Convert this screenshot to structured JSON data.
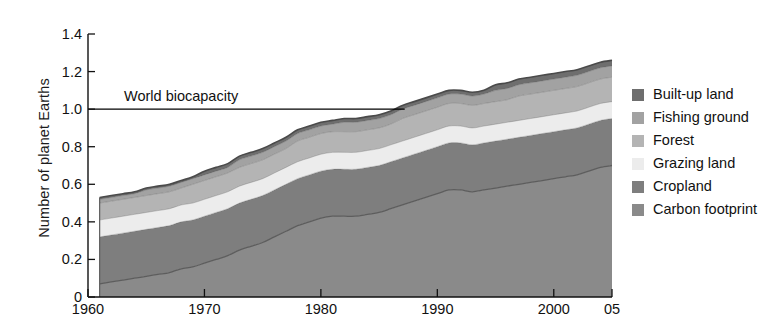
{
  "chart_data": {
    "type": "area",
    "stacked": true,
    "title": "",
    "xlabel": "",
    "ylabel": "Number of planet Earths",
    "xlim": [
      1960,
      2005
    ],
    "ylim": [
      0,
      1.4
    ],
    "yticks": [
      "0",
      "0.2",
      "0.4",
      "0.6",
      "0.8",
      "1.0",
      "1.2",
      "1.4"
    ],
    "ytick_values": [
      0,
      0.2,
      0.4,
      0.6,
      0.8,
      1.0,
      1.2,
      1.4
    ],
    "xticks": [
      "1960",
      "1970",
      "1980",
      "1990",
      "2000",
      "05"
    ],
    "xtick_values": [
      1960,
      1970,
      1980,
      1990,
      2000,
      2005
    ],
    "grid": false,
    "legend_position": "right",
    "x": [
      1961,
      1962,
      1963,
      1964,
      1965,
      1966,
      1967,
      1968,
      1969,
      1970,
      1971,
      1972,
      1973,
      1974,
      1975,
      1976,
      1977,
      1978,
      1979,
      1980,
      1981,
      1982,
      1983,
      1984,
      1985,
      1986,
      1987,
      1988,
      1989,
      1990,
      1991,
      1992,
      1993,
      1994,
      1995,
      1996,
      1997,
      1998,
      1999,
      2000,
      2001,
      2002,
      2003,
      2004,
      2005
    ],
    "series": [
      {
        "name": "Carbon footprint",
        "color": "#8a8a8a",
        "values": [
          0.07,
          0.08,
          0.09,
          0.1,
          0.11,
          0.12,
          0.13,
          0.15,
          0.16,
          0.18,
          0.2,
          0.22,
          0.25,
          0.27,
          0.29,
          0.32,
          0.35,
          0.38,
          0.4,
          0.42,
          0.43,
          0.43,
          0.43,
          0.44,
          0.45,
          0.47,
          0.49,
          0.51,
          0.53,
          0.55,
          0.57,
          0.57,
          0.56,
          0.57,
          0.58,
          0.59,
          0.6,
          0.61,
          0.62,
          0.63,
          0.64,
          0.65,
          0.67,
          0.69,
          0.7
        ]
      },
      {
        "name": "Cropland",
        "color": "#7e7e7e",
        "values": [
          0.25,
          0.25,
          0.25,
          0.25,
          0.25,
          0.25,
          0.25,
          0.25,
          0.25,
          0.25,
          0.25,
          0.25,
          0.25,
          0.25,
          0.25,
          0.25,
          0.25,
          0.25,
          0.25,
          0.25,
          0.25,
          0.25,
          0.25,
          0.25,
          0.25,
          0.25,
          0.25,
          0.25,
          0.25,
          0.25,
          0.25,
          0.25,
          0.25,
          0.25,
          0.25,
          0.25,
          0.25,
          0.25,
          0.25,
          0.25,
          0.25,
          0.25,
          0.25,
          0.25,
          0.25
        ]
      },
      {
        "name": "Grazing land",
        "color": "#ececec",
        "values": [
          0.09,
          0.09,
          0.09,
          0.09,
          0.09,
          0.09,
          0.09,
          0.09,
          0.09,
          0.09,
          0.09,
          0.09,
          0.09,
          0.09,
          0.09,
          0.09,
          0.09,
          0.09,
          0.09,
          0.09,
          0.09,
          0.09,
          0.09,
          0.09,
          0.09,
          0.09,
          0.09,
          0.09,
          0.09,
          0.09,
          0.09,
          0.09,
          0.09,
          0.09,
          0.09,
          0.09,
          0.09,
          0.09,
          0.09,
          0.09,
          0.09,
          0.09,
          0.09,
          0.09,
          0.09
        ]
      },
      {
        "name": "Forest",
        "color": "#b4b4b4",
        "values": [
          0.09,
          0.09,
          0.09,
          0.09,
          0.09,
          0.09,
          0.09,
          0.09,
          0.1,
          0.1,
          0.1,
          0.1,
          0.1,
          0.1,
          0.1,
          0.1,
          0.1,
          0.11,
          0.11,
          0.11,
          0.11,
          0.11,
          0.11,
          0.11,
          0.11,
          0.11,
          0.12,
          0.12,
          0.12,
          0.12,
          0.12,
          0.12,
          0.12,
          0.12,
          0.12,
          0.12,
          0.13,
          0.13,
          0.13,
          0.13,
          0.13,
          0.13,
          0.13,
          0.13,
          0.13
        ]
      },
      {
        "name": "Fishing ground",
        "color": "#a2a2a2",
        "values": [
          0.02,
          0.02,
          0.02,
          0.02,
          0.03,
          0.03,
          0.03,
          0.03,
          0.03,
          0.03,
          0.03,
          0.03,
          0.04,
          0.04,
          0.04,
          0.04,
          0.04,
          0.04,
          0.04,
          0.04,
          0.04,
          0.05,
          0.05,
          0.05,
          0.05,
          0.05,
          0.05,
          0.05,
          0.05,
          0.05,
          0.05,
          0.05,
          0.05,
          0.05,
          0.06,
          0.06,
          0.06,
          0.06,
          0.06,
          0.06,
          0.06,
          0.06,
          0.06,
          0.06,
          0.06
        ]
      },
      {
        "name": "Built-up land",
        "color": "#6e6e6e",
        "values": [
          0.01,
          0.01,
          0.01,
          0.01,
          0.01,
          0.01,
          0.01,
          0.01,
          0.01,
          0.02,
          0.02,
          0.02,
          0.02,
          0.02,
          0.02,
          0.02,
          0.02,
          0.02,
          0.02,
          0.02,
          0.02,
          0.02,
          0.02,
          0.02,
          0.02,
          0.02,
          0.02,
          0.02,
          0.02,
          0.02,
          0.02,
          0.02,
          0.02,
          0.02,
          0.03,
          0.03,
          0.03,
          0.03,
          0.03,
          0.03,
          0.03,
          0.03,
          0.03,
          0.03,
          0.03
        ]
      }
    ],
    "total": [
      0.53,
      0.54,
      0.55,
      0.56,
      0.58,
      0.59,
      0.6,
      0.62,
      0.64,
      0.67,
      0.69,
      0.71,
      0.75,
      0.77,
      0.79,
      0.82,
      0.85,
      0.89,
      0.91,
      0.93,
      0.94,
      0.95,
      0.95,
      0.96,
      0.97,
      0.99,
      1.02,
      1.04,
      1.06,
      1.08,
      1.1,
      1.1,
      1.09,
      1.1,
      1.13,
      1.14,
      1.16,
      1.17,
      1.18,
      1.19,
      1.2,
      1.21,
      1.24,
      1.28,
      1.32
    ],
    "reference_line": {
      "label": "World biocapacity",
      "value": 1.0,
      "color": "#000000"
    }
  },
  "legend": {
    "items": [
      {
        "label": "Built-up land",
        "color": "#6e6e6e"
      },
      {
        "label": "Fishing ground",
        "color": "#a2a2a2"
      },
      {
        "label": "Forest",
        "color": "#b4b4b4"
      },
      {
        "label": "Grazing land",
        "color": "#ececec"
      },
      {
        "label": "Cropland",
        "color": "#7e7e7e"
      },
      {
        "label": "Carbon footprint",
        "color": "#8a8a8a"
      }
    ]
  }
}
